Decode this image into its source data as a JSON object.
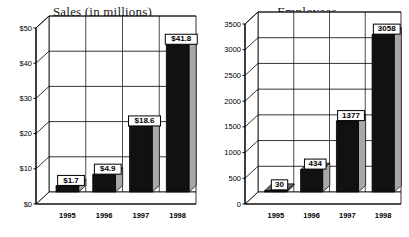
{
  "charts": [
    {
      "id": "sales",
      "title": "Sales (in millions)"
    },
    {
      "id": "employees",
      "title": "Employees"
    }
  ],
  "chart_data": [
    {
      "type": "bar",
      "title": "Sales (in millions)",
      "xlabel": "",
      "ylabel": "",
      "categories": [
        "1995",
        "1996",
        "1997",
        "1998"
      ],
      "values": [
        1.7,
        4.9,
        18.6,
        41.8
      ],
      "data_labels": [
        "$1.7",
        "$4.9",
        "$18.6",
        "$41.8"
      ],
      "ylim": [
        0,
        50
      ],
      "yticks": [
        0,
        10,
        20,
        30,
        40,
        50
      ],
      "ytick_labels": [
        "$0",
        "$10",
        "$20",
        "$30",
        "$40",
        "$50"
      ],
      "grid": true,
      "legend": "none",
      "three_d": true,
      "colors": {
        "bar_front": "#111111",
        "bar_side": "#a8a8a8",
        "bar_top": "#6e6e6e",
        "plot_background": "#ffffff",
        "axis": "#000000",
        "label_box": "#ffffff",
        "label_border": "#000000"
      }
    },
    {
      "type": "bar",
      "title": "Employees",
      "xlabel": "",
      "ylabel": "",
      "categories": [
        "1995",
        "1996",
        "1997",
        "1998"
      ],
      "values": [
        30,
        434,
        1377,
        3058
      ],
      "data_labels": [
        "30",
        "434",
        "1377",
        "3058"
      ],
      "ylim": [
        0,
        3500
      ],
      "yticks": [
        0,
        500,
        1000,
        1500,
        2000,
        2500,
        3000,
        3500
      ],
      "ytick_labels": [
        "0",
        "500",
        "1000",
        "1500",
        "2000",
        "2500",
        "3000",
        "3500"
      ],
      "grid": true,
      "legend": "none",
      "three_d": true,
      "colors": {
        "bar_front": "#111111",
        "bar_side": "#a8a8a8",
        "bar_top": "#6e6e6e",
        "plot_background": "#ffffff",
        "axis": "#000000",
        "label_box": "#ffffff",
        "label_border": "#000000"
      }
    }
  ]
}
